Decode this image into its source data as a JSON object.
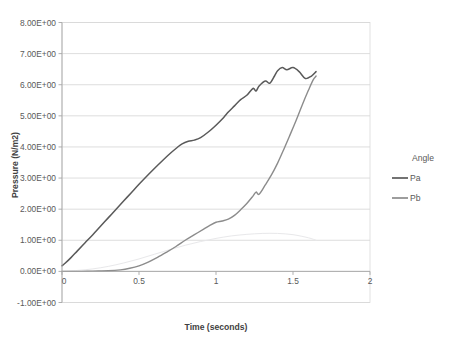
{
  "chart_data": {
    "type": "line",
    "title": "",
    "xlabel": "Time (seconds)",
    "ylabel": "Pressure (N/m2)",
    "xlim": [
      0,
      2
    ],
    "ylim": [
      -1,
      8
    ],
    "xticks": [
      "0",
      "0.5",
      "1",
      "1.5",
      "2"
    ],
    "xtick_values": [
      0,
      0.5,
      1,
      1.5,
      2
    ],
    "yticks": [
      "-1.00E+00",
      "0.00E+00",
      "1.00E+00",
      "2.00E+00",
      "3.00E+00",
      "4.00E+00",
      "5.00E+00",
      "6.00E+00",
      "7.00E+00",
      "8.00E+00"
    ],
    "ytick_values": [
      -1,
      0,
      1,
      2,
      3,
      4,
      5,
      6,
      7,
      8
    ],
    "grid": "horizontal",
    "legend_position": "right",
    "series": [
      {
        "name": "Angle",
        "color": "#e8e8ea",
        "width": 1.0,
        "x": [
          0.0,
          0.1,
          0.2,
          0.3,
          0.4,
          0.5,
          0.6,
          0.7,
          0.8,
          0.9,
          1.0,
          1.1,
          1.2,
          1.3,
          1.4,
          1.5,
          1.6,
          1.65
        ],
        "y": [
          0.0,
          0.03,
          0.08,
          0.16,
          0.27,
          0.4,
          0.55,
          0.7,
          0.84,
          0.96,
          1.06,
          1.14,
          1.19,
          1.22,
          1.22,
          1.18,
          1.08,
          1.0
        ]
      },
      {
        "name": "Pa",
        "color": "#5a5a5a",
        "width": 1.5,
        "x": [
          0.0,
          0.02,
          0.06,
          0.1,
          0.15,
          0.2,
          0.25,
          0.3,
          0.35,
          0.4,
          0.45,
          0.5,
          0.55,
          0.6,
          0.65,
          0.7,
          0.75,
          0.78,
          0.82,
          0.86,
          0.9,
          0.95,
          1.0,
          1.05,
          1.08,
          1.12,
          1.16,
          1.2,
          1.24,
          1.26,
          1.28,
          1.32,
          1.35,
          1.38,
          1.4,
          1.43,
          1.46,
          1.5,
          1.54,
          1.58,
          1.62,
          1.65
        ],
        "y": [
          0.18,
          0.26,
          0.45,
          0.66,
          0.92,
          1.18,
          1.45,
          1.72,
          1.99,
          2.26,
          2.53,
          2.8,
          3.06,
          3.31,
          3.55,
          3.78,
          3.99,
          4.1,
          4.18,
          4.22,
          4.3,
          4.48,
          4.7,
          4.95,
          5.12,
          5.32,
          5.52,
          5.66,
          5.88,
          5.8,
          5.96,
          6.12,
          6.05,
          6.28,
          6.45,
          6.55,
          6.48,
          6.55,
          6.42,
          6.2,
          6.28,
          6.42
        ]
      },
      {
        "name": "Pb",
        "color": "#8c8c8c",
        "width": 1.4,
        "x": [
          0.0,
          0.1,
          0.2,
          0.3,
          0.38,
          0.44,
          0.5,
          0.56,
          0.62,
          0.68,
          0.74,
          0.8,
          0.86,
          0.92,
          0.96,
          1.0,
          1.04,
          1.08,
          1.12,
          1.16,
          1.2,
          1.24,
          1.26,
          1.28,
          1.32,
          1.36,
          1.4,
          1.44,
          1.48,
          1.52,
          1.56,
          1.6,
          1.63,
          1.65
        ],
        "y": [
          0.0,
          0.0,
          0.01,
          0.02,
          0.05,
          0.1,
          0.18,
          0.3,
          0.45,
          0.62,
          0.8,
          1.0,
          1.18,
          1.36,
          1.48,
          1.58,
          1.62,
          1.68,
          1.8,
          1.98,
          2.18,
          2.42,
          2.55,
          2.48,
          2.78,
          3.1,
          3.48,
          3.92,
          4.38,
          4.85,
          5.35,
          5.82,
          6.15,
          6.28
        ]
      }
    ]
  },
  "legend": {
    "items": [
      {
        "label": "Angle"
      },
      {
        "label": "Pa"
      },
      {
        "label": "Pb"
      }
    ]
  },
  "caption": {
    "text": ""
  }
}
